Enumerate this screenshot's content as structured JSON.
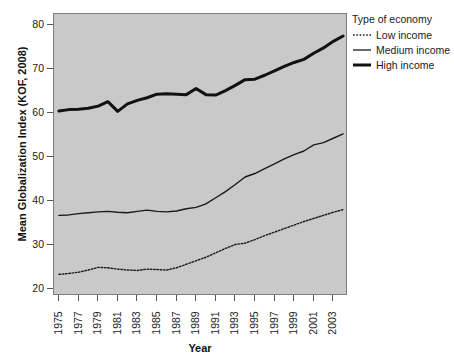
{
  "chart_data": {
    "type": "line",
    "title": "",
    "xlabel": "Year",
    "ylabel": "Mean Globalization Index (KOF, 2008)",
    "xlim": [
      1974.5,
      2004.5
    ],
    "ylim": [
      18.5,
      82.5
    ],
    "grid": false,
    "legend_position": "right",
    "legend_title": "Type of economy",
    "xticks": [
      "1975",
      "1977",
      "1979",
      "1981",
      "1983",
      "1985",
      "1987",
      "1989",
      "1991",
      "1993",
      "1995",
      "1997",
      "1999",
      "2001",
      "2003"
    ],
    "yticks": [
      "20",
      "30",
      "40",
      "50",
      "60",
      "70",
      "80"
    ],
    "x": [
      1975,
      1976,
      1977,
      1978,
      1979,
      1980,
      1981,
      1982,
      1983,
      1984,
      1985,
      1986,
      1987,
      1988,
      1989,
      1990,
      1991,
      1992,
      1993,
      1994,
      1995,
      1996,
      1997,
      1998,
      1999,
      2000,
      2001,
      2002,
      2003,
      2004
    ],
    "series": [
      {
        "name": "Low income",
        "style": "dotted",
        "width": 1.4,
        "color": "#1a1a1a",
        "values": [
          23.4,
          23.6,
          23.9,
          24.4,
          25.0,
          24.9,
          24.6,
          24.4,
          24.3,
          24.6,
          24.5,
          24.4,
          24.9,
          25.7,
          26.5,
          27.3,
          28.3,
          29.3,
          30.2,
          30.5,
          31.3,
          32.2,
          33.0,
          33.8,
          34.6,
          35.4,
          36.1,
          36.8,
          37.5,
          38.1
        ]
      },
      {
        "name": "Medium income",
        "style": "solid",
        "width": 1.4,
        "color": "#1a1a1a",
        "values": [
          36.8,
          36.9,
          37.2,
          37.4,
          37.6,
          37.7,
          37.5,
          37.4,
          37.7,
          38.0,
          37.7,
          37.6,
          37.8,
          38.3,
          38.6,
          39.4,
          40.8,
          42.2,
          43.8,
          45.5,
          46.3,
          47.4,
          48.5,
          49.6,
          50.6,
          51.4,
          52.8,
          53.3,
          54.3,
          55.3
        ]
      },
      {
        "name": "High income",
        "style": "solid",
        "width": 3.0,
        "color": "#111111",
        "values": [
          60.5,
          60.8,
          60.9,
          61.1,
          61.6,
          62.6,
          60.4,
          62.1,
          62.9,
          63.5,
          64.3,
          64.4,
          64.3,
          64.2,
          65.6,
          64.2,
          64.1,
          65.1,
          66.3,
          67.6,
          67.7,
          68.6,
          69.6,
          70.6,
          71.5,
          72.2,
          73.6,
          74.8,
          76.3,
          77.5
        ]
      }
    ]
  },
  "legend": {
    "title": "Type of economy",
    "items": [
      {
        "label": "Low income",
        "style": "dotted"
      },
      {
        "label": "Medium income",
        "style": "thin"
      },
      {
        "label": "High income",
        "style": "thick"
      }
    ]
  },
  "axes": {
    "y_title": "Mean Globalization Index (KOF, 2008)",
    "x_title": "Year"
  },
  "colors": {
    "panel_background": "#c9c9c9",
    "panel_border": "#7d7d7d",
    "line": "#1a1a1a",
    "text": "#1a1a1a",
    "figure_background": "#ffffff"
  }
}
